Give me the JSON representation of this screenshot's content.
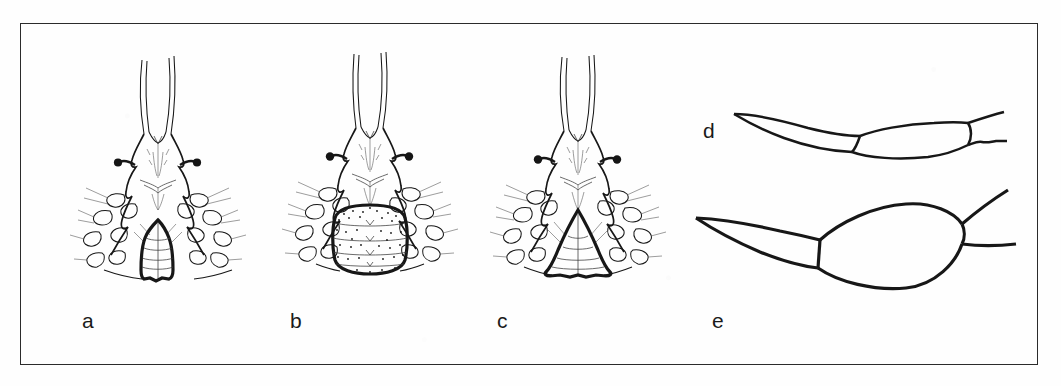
{
  "figure": {
    "type": "scientific-line-drawing-plate",
    "background_color": "#fefefe",
    "ink_color": "#171717",
    "frame": {
      "present": true,
      "color": "#2b2b2b",
      "x": 20,
      "y": 23,
      "width": 1018,
      "height": 342
    },
    "panels": [
      {
        "id": "a",
        "label": "a",
        "label_x": 82,
        "label_y": 310,
        "subject": "ventral gnathosoma and genital region",
        "genital_plate_shape": "narrow dome with pointed apex",
        "has_stippling": false
      },
      {
        "id": "b",
        "label": "b",
        "label_x": 290,
        "label_y": 310,
        "subject": "ventral gnathosoma and genital region",
        "genital_plate_shape": "broad rounded barrel, stippled with transverse bands",
        "has_stippling": true
      },
      {
        "id": "c",
        "label": "c",
        "label_x": 497,
        "label_y": 310,
        "subject": "ventral gnathosoma and genital region",
        "genital_plate_shape": "triangular cone with pointed apex",
        "has_stippling": false
      },
      {
        "id": "d",
        "label": "d",
        "label_x": 703,
        "label_y": 120,
        "subject": "chelicera / claw segment, slender form",
        "orientation": "lateral, tip pointing left"
      },
      {
        "id": "e",
        "label": "e",
        "label_x": 712,
        "label_y": 310,
        "subject": "chelicera / claw segment, swollen form",
        "orientation": "lateral, tip pointing left"
      }
    ]
  }
}
